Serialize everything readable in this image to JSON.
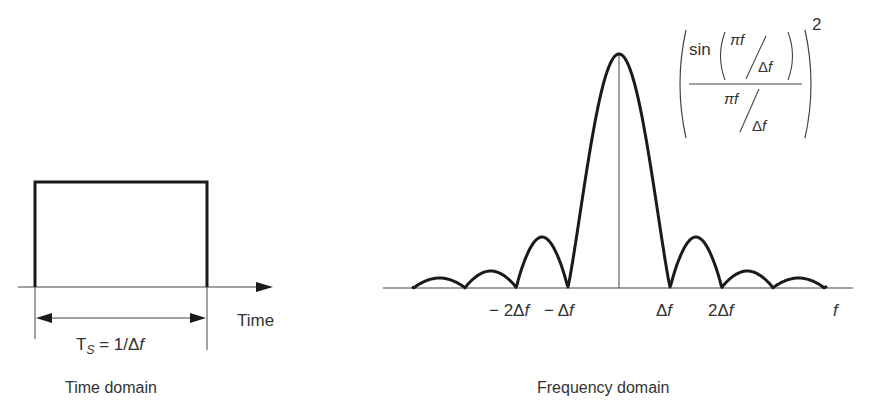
{
  "figure": {
    "time_domain": {
      "caption": "Time domain",
      "axis_label": "Time",
      "width_label_main": "T",
      "width_label_sub": "S",
      "width_label_rest": " = 1/Δ",
      "width_label_var": "f"
    },
    "frequency_domain": {
      "caption": "Frequency domain",
      "axis_label": "f",
      "tick_labels": [
        {
          "text": "− 2Δ",
          "var": "f",
          "x": 0
        },
        {
          "text": "− Δ",
          "var": "f",
          "x": 0
        },
        {
          "text": "Δ",
          "var": "f",
          "x": 0
        },
        {
          "text": "2Δ",
          "var": "f",
          "x": 0
        }
      ],
      "formula": {
        "sin": "sin",
        "pi_f": "πf",
        "delta_f": "Δf",
        "exponent": "2"
      }
    },
    "colors": {
      "stroke": "#1a1a1a",
      "axis": "#444444",
      "text": "#333333"
    }
  },
  "chart_data": [
    {
      "type": "line",
      "title": "Time domain",
      "xlabel": "Time",
      "ylabel": "",
      "description": "Rectangular pulse of duration T_S = 1/Δf",
      "x": [
        0,
        0,
        1,
        1
      ],
      "y": [
        0,
        1,
        1,
        0
      ],
      "annotations": [
        "T_S = 1/Δf"
      ]
    },
    {
      "type": "line",
      "title": "Frequency domain",
      "xlabel": "f",
      "ylabel": "",
      "description": "sinc² spectrum: (sin(πf/Δf)/(πf/Δf))²",
      "x_ticks": [
        "−2Δf",
        "−Δf",
        "Δf",
        "2Δf"
      ],
      "zero_crossings_in_df": [
        -4,
        -3,
        -2,
        -1,
        1,
        2,
        3,
        4
      ],
      "peak_at": 0,
      "peak_value": 1.0,
      "sidelobe_peaks_relative": [
        0.047,
        0.017,
        0.008
      ],
      "annotations": [
        "(sin(πf/Δf) / (πf/Δf))²"
      ]
    }
  ]
}
